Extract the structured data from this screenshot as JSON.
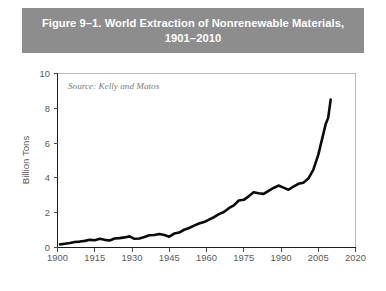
{
  "figure": {
    "title": "Figure 9–1. World Extraction of Nonrenewable Materials,\n1901–2010",
    "title_line1": "Figure 9–1. World Extraction of Nonrenewable Materials,",
    "title_line2": "1901–2010",
    "banner_color": "#8d8d8d",
    "banner_text_color": "#ffffff",
    "background_color": "#ffffff"
  },
  "chart_data": {
    "type": "line",
    "title": "Figure 9–1. World Extraction of Nonrenewable Materials, 1901–2010",
    "subtitle": "",
    "source": "Source: Kelly and Matos",
    "xlabel": "",
    "ylabel": "Billion Tons",
    "xlim": [
      1900,
      2020
    ],
    "ylim": [
      0,
      10
    ],
    "xticks": [
      1900,
      1915,
      1930,
      1945,
      1960,
      1975,
      1990,
      2005,
      2020
    ],
    "xtick_labels": [
      "1900",
      "1915",
      "1930",
      "1945",
      "1960",
      "1975",
      "1990",
      "2005",
      "2020"
    ],
    "yticks": [
      0,
      2,
      4,
      6,
      8,
      10
    ],
    "ytick_labels": [
      "0",
      "2",
      "4",
      "6",
      "8",
      "10"
    ],
    "grid": false,
    "legend": false,
    "line_color": "#0b0b0b",
    "line_width": 2.6,
    "series": [
      {
        "name": "World extraction of nonrenewable materials",
        "units": "Billion Tons",
        "x": [
          1901,
          1903,
          1905,
          1907,
          1909,
          1911,
          1913,
          1915,
          1917,
          1919,
          1921,
          1923,
          1925,
          1927,
          1929,
          1931,
          1933,
          1935,
          1937,
          1939,
          1941,
          1943,
          1945,
          1947,
          1949,
          1951,
          1953,
          1955,
          1957,
          1959,
          1961,
          1963,
          1965,
          1967,
          1969,
          1971,
          1973,
          1975,
          1977,
          1979,
          1981,
          1983,
          1985,
          1987,
          1989,
          1991,
          1993,
          1995,
          1997,
          1999,
          2001,
          2003,
          2005,
          2007,
          2008,
          2009,
          2010
        ],
        "y": [
          0.18,
          0.22,
          0.26,
          0.32,
          0.34,
          0.38,
          0.44,
          0.42,
          0.5,
          0.44,
          0.4,
          0.52,
          0.54,
          0.58,
          0.64,
          0.5,
          0.52,
          0.6,
          0.7,
          0.72,
          0.78,
          0.72,
          0.62,
          0.8,
          0.86,
          1.02,
          1.12,
          1.26,
          1.38,
          1.46,
          1.6,
          1.74,
          1.92,
          2.04,
          2.26,
          2.42,
          2.7,
          2.74,
          2.94,
          3.18,
          3.12,
          3.08,
          3.26,
          3.42,
          3.56,
          3.44,
          3.32,
          3.5,
          3.66,
          3.72,
          3.96,
          4.46,
          5.32,
          6.5,
          7.1,
          7.45,
          8.5
        ]
      }
    ]
  },
  "axes": {
    "y_axis_title": "Billion Tons",
    "source_note": "Source: Kelly and Matos"
  }
}
